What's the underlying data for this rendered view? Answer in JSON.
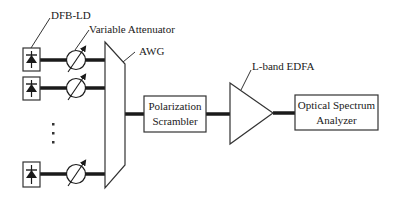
{
  "diagram": {
    "type": "optical-setup-block-diagram",
    "labels": {
      "laser": "DFB-LD",
      "attenuator": "Variable Attenuator",
      "awg": "AWG",
      "scrambler_line1": "Polarization",
      "scrambler_line2": "Scrambler",
      "amplifier": "L-band EDFA",
      "osa_line1": "Optical Spectrum",
      "osa_line2": "Analyzer",
      "ellipsis": "⋮"
    },
    "nodes": [
      {
        "id": "ld1",
        "kind": "laser-diode",
        "icon": "diode-icon"
      },
      {
        "id": "ld2",
        "kind": "laser-diode",
        "icon": "diode-icon"
      },
      {
        "id": "ldN",
        "kind": "laser-diode",
        "icon": "diode-icon"
      },
      {
        "id": "att1",
        "kind": "variable-attenuator",
        "icon": "variable-attenuator-icon"
      },
      {
        "id": "att2",
        "kind": "variable-attenuator",
        "icon": "variable-attenuator-icon"
      },
      {
        "id": "attN",
        "kind": "variable-attenuator",
        "icon": "variable-attenuator-icon"
      },
      {
        "id": "awg",
        "kind": "arrayed-waveguide-grating"
      },
      {
        "id": "scrambler",
        "kind": "polarization-scrambler"
      },
      {
        "id": "edfa",
        "kind": "amplifier",
        "icon": "amplifier-triangle-icon"
      },
      {
        "id": "osa",
        "kind": "optical-spectrum-analyzer"
      }
    ],
    "edges": [
      [
        "ld1",
        "att1"
      ],
      [
        "att1",
        "awg"
      ],
      [
        "ld2",
        "att2"
      ],
      [
        "att2",
        "awg"
      ],
      [
        "ldN",
        "attN"
      ],
      [
        "attN",
        "awg"
      ],
      [
        "awg",
        "scrambler"
      ],
      [
        "scrambler",
        "edfa"
      ],
      [
        "edfa",
        "osa"
      ]
    ]
  }
}
